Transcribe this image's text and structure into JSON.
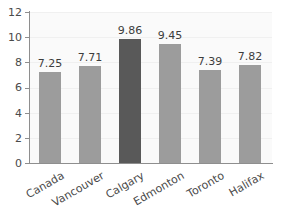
{
  "chart_data": {
    "type": "bar",
    "title": "",
    "subtitle": "",
    "xlabel": "",
    "ylabel": "",
    "categories": [
      "Canada",
      "Vancouver",
      "Calgary",
      "Edmonton",
      "Toronto",
      "Halifax"
    ],
    "values": [
      7.25,
      7.71,
      9.86,
      9.45,
      7.39,
      7.82
    ],
    "value_labels": [
      "7.25",
      "7.71",
      "9.86",
      "9.45",
      "7.39",
      "7.82"
    ],
    "ylim": [
      0,
      12
    ],
    "ytick_labels": [
      "12",
      "10",
      "8",
      "6",
      "4",
      "2",
      "0"
    ],
    "ytick_values": [
      12,
      10,
      8,
      6,
      4,
      2,
      0
    ],
    "grid": true,
    "legend": false,
    "legend_position": "none",
    "bar_color": "#9c9c9c",
    "highlight_color": "#595959",
    "highlight_category": "Calgary",
    "axis_color": "#8e8e8e",
    "plot_background": "#fafafa",
    "label_rotation": -30
  }
}
